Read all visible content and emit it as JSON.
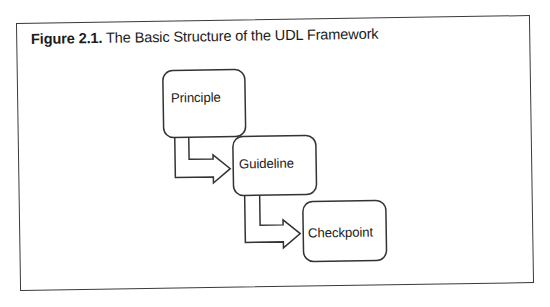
{
  "figure": {
    "label": "Figure 2.1.",
    "title": "The Basic Structure of the UDL Framework"
  },
  "diagram": {
    "type": "hierarchy",
    "nodes": [
      {
        "id": "principle",
        "label": "Principle",
        "level": 1
      },
      {
        "id": "guideline",
        "label": "Guideline",
        "level": 2
      },
      {
        "id": "checkpoint",
        "label": "Checkpoint",
        "level": 3
      }
    ],
    "edges": [
      {
        "from": "principle",
        "to": "guideline",
        "style": "outlined-elbow-arrow"
      },
      {
        "from": "guideline",
        "to": "checkpoint",
        "style": "outlined-elbow-arrow"
      }
    ],
    "line_color": "#333333",
    "background": "#ffffff"
  }
}
